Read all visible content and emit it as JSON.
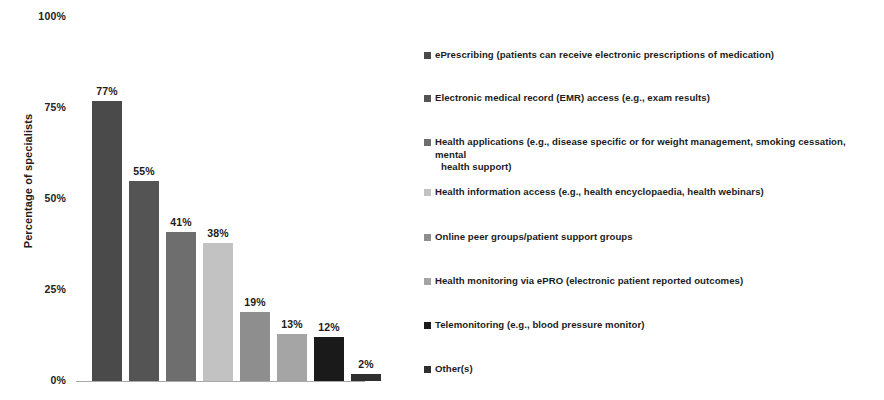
{
  "chart_data": {
    "type": "bar",
    "title": "",
    "xlabel": "",
    "ylabel": "Percentage of specialists",
    "ylim": [
      0,
      100
    ],
    "grid": false,
    "legend_position": "right",
    "y_tick_labels": [
      "100%",
      "75%",
      "50%",
      "25%",
      "0%"
    ],
    "y_tick_values": [
      100,
      75,
      50,
      25,
      0
    ],
    "categories": [
      "ePrescribing (patients can receive electronic prescriptions of medication)",
      "Electronic medical record (EMR) access (e.g., exam results)",
      "Health applications (e.g., disease specific or for weight management, smoking cessation, mental health support)",
      "Health information access (e.g., health encyclopaedia, health webinars)",
      "Online peer groups/patient support groups",
      "Health monitoring via ePRO (electronic patient reported outcomes)",
      "Telemonitoring (e.g., blood pressure monitor)",
      "Other(s)"
    ],
    "values": [
      77,
      55,
      41,
      38,
      19,
      13,
      12,
      2
    ],
    "data_labels": [
      "77%",
      "55%",
      "41%",
      "38%",
      "19%",
      "13%",
      "12%",
      "2%"
    ],
    "colors": [
      "#4a4a4a",
      "#545454",
      "#6e6e6e",
      "#c2c2c2",
      "#8e8e8e",
      "#a5a5a5",
      "#1a1a1a",
      "#2f2f2f"
    ]
  },
  "axis": {
    "y_title": "Percentage of specialists",
    "ticks": [
      {
        "label": "100%",
        "value": 100
      },
      {
        "label": "75%",
        "value": 75
      },
      {
        "label": "50%",
        "value": 50
      },
      {
        "label": "25%",
        "value": 25
      },
      {
        "label": "0%",
        "value": 0
      }
    ]
  },
  "legend": {
    "items": [
      {
        "label": "ePrescribing (patients can receive electronic prescriptions of medication)",
        "color": "#4a4a4a",
        "line2": ""
      },
      {
        "label": "Electronic medical record (EMR) access (e.g., exam results)",
        "color": "#545454",
        "line2": ""
      },
      {
        "label": "Health applications (e.g., disease specific or for weight management, smoking cessation, mental",
        "color": "#6e6e6e",
        "line2": "health support)"
      },
      {
        "label": "Health information access (e.g., health encyclopaedia, health webinars)",
        "color": "#c2c2c2",
        "line2": ""
      },
      {
        "label": "Online peer groups/patient support groups",
        "color": "#8e8e8e",
        "line2": ""
      },
      {
        "label": "Health monitoring via ePRO (electronic patient reported outcomes)",
        "color": "#a5a5a5",
        "line2": ""
      },
      {
        "label": "Telemonitoring (e.g., blood pressure monitor)",
        "color": "#1a1a1a",
        "line2": ""
      },
      {
        "label": "Other(s)",
        "color": "#2f2f2f",
        "line2": ""
      }
    ]
  }
}
